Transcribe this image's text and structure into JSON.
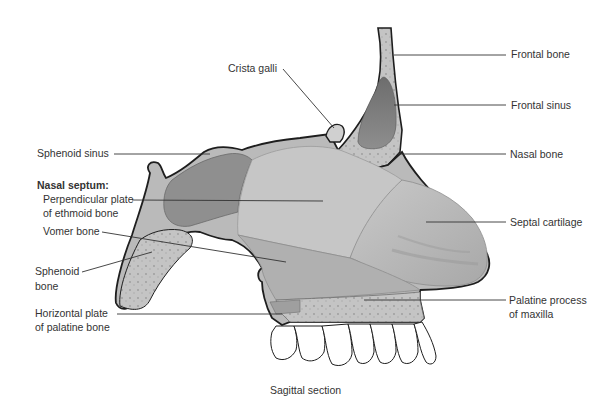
{
  "figure": {
    "caption": "Sagittal section",
    "labels_left": {
      "sphenoid_sinus": "Sphenoid sinus",
      "nasal_septum_heading": "Nasal septum:",
      "perpendicular_plate_line1": "Perpendicular plate",
      "perpendicular_plate_line2": "of ethmoid bone",
      "vomer_bone": "Vomer bone",
      "sphenoid_bone_line1": "Sphenoid",
      "sphenoid_bone_line2": "bone",
      "horizontal_plate_line1": "Horizontal plate",
      "horizontal_plate_line2": "of palatine bone"
    },
    "labels_top": {
      "crista_galli": "Crista galli"
    },
    "labels_right": {
      "frontal_bone": "Frontal bone",
      "frontal_sinus": "Frontal sinus",
      "nasal_bone": "Nasal bone",
      "septal_cartilage": "Septal cartilage",
      "palatine_process_line1": "Palatine process",
      "palatine_process_line2": "of maxilla"
    },
    "colors": {
      "outline": "#1e1e1e",
      "bone_fill": "#bdbdbd",
      "plate_fill": "#a9a9a9",
      "sinus_fill": "#7e7e7e",
      "cartilage_fill": "#b4b4b4",
      "teeth_fill": "#ffffff",
      "leader_line": "#333333"
    }
  }
}
